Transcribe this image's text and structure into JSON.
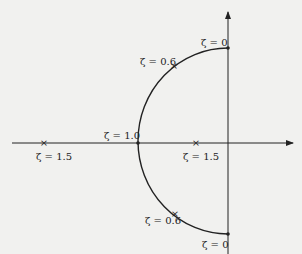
{
  "diagram": {
    "type": "root-locus",
    "colors": {
      "background": "#f1f1ef",
      "ink": "#222222"
    },
    "axes": {
      "real_axis": {
        "arrow": "right"
      },
      "imag_axis": {
        "arrow": "up"
      }
    },
    "points": [
      {
        "id": "zeta0-upper",
        "label": "ζ = 0",
        "position": "upper imaginary axis"
      },
      {
        "id": "zeta06-upper",
        "label": "ζ = 0.6",
        "position": "upper arc"
      },
      {
        "id": "zeta10",
        "label": "ζ = 1.0",
        "position": "real axis, arc intersection"
      },
      {
        "id": "zeta15-left",
        "label": "ζ = 1.5",
        "position": "left real axis"
      },
      {
        "id": "zeta15-right",
        "label": "ζ = 1.5",
        "position": "right real axis"
      },
      {
        "id": "zeta06-lower",
        "label": "ζ = 0.6",
        "position": "lower arc"
      },
      {
        "id": "zeta0-lower",
        "label": "ζ = 0",
        "position": "lower imaginary axis"
      }
    ]
  }
}
